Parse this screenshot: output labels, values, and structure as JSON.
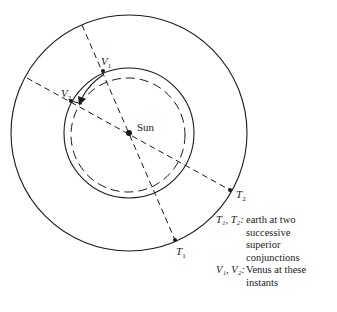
{
  "diagram": {
    "center": {
      "label": "Sun",
      "x": 129,
      "y": 133
    },
    "orbits": [
      {
        "name": "earth-orbit",
        "style": "solid",
        "cx": 129,
        "cy": 133,
        "r": 118
      },
      {
        "name": "venus-orbit",
        "style": "solid",
        "cx": 129,
        "cy": 133,
        "r": 65
      },
      {
        "name": "venus-orbit-reference",
        "style": "dashed",
        "cx": 128,
        "cy": 135,
        "r": 57
      }
    ],
    "lines": [
      {
        "name": "conjunction-line-1",
        "from": [
          82,
          25
        ],
        "to": [
          175,
          240
        ]
      },
      {
        "name": "conjunction-line-2",
        "from": [
          27,
          78
        ],
        "to": [
          230,
          190
        ]
      }
    ],
    "points": {
      "V1": {
        "label": "V",
        "sub": "1",
        "x": 103,
        "y": 71
      },
      "V2": {
        "label": "V",
        "sub": "2",
        "x": 71,
        "y": 101
      },
      "T1": {
        "label": "T",
        "sub": "1",
        "x": 175,
        "y": 240
      },
      "T2": {
        "label": "T",
        "sub": "2",
        "x": 230,
        "y": 190
      }
    },
    "sun_label": "Sun"
  },
  "legend": [
    {
      "key": "T₁, T₂:",
      "lines": [
        "earth at two",
        "successive",
        "superior",
        "conjunctions"
      ]
    },
    {
      "key": "V₁, V₂:",
      "lines": [
        "Venus at these",
        "instants"
      ]
    }
  ],
  "colors": {
    "ink": "#1a1a1a",
    "paper": "#ffffff"
  }
}
